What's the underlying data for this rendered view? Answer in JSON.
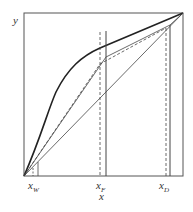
{
  "diagram": {
    "type": "McCabe-Thiele distillation diagram",
    "axes": {
      "xlabel": "x",
      "ylabel": "y"
    },
    "ticks": [
      {
        "id": "xw",
        "base": "x",
        "sub": "W"
      },
      {
        "id": "xf",
        "base": "x",
        "sub": "F"
      },
      {
        "id": "xd",
        "base": "x",
        "sub": "D"
      }
    ],
    "curves": [
      "equilibrium-curve",
      "diagonal",
      "operating-line-solid",
      "operating-line-dashed"
    ],
    "colors": {
      "line": "#333333",
      "background": "#ffffff"
    }
  }
}
